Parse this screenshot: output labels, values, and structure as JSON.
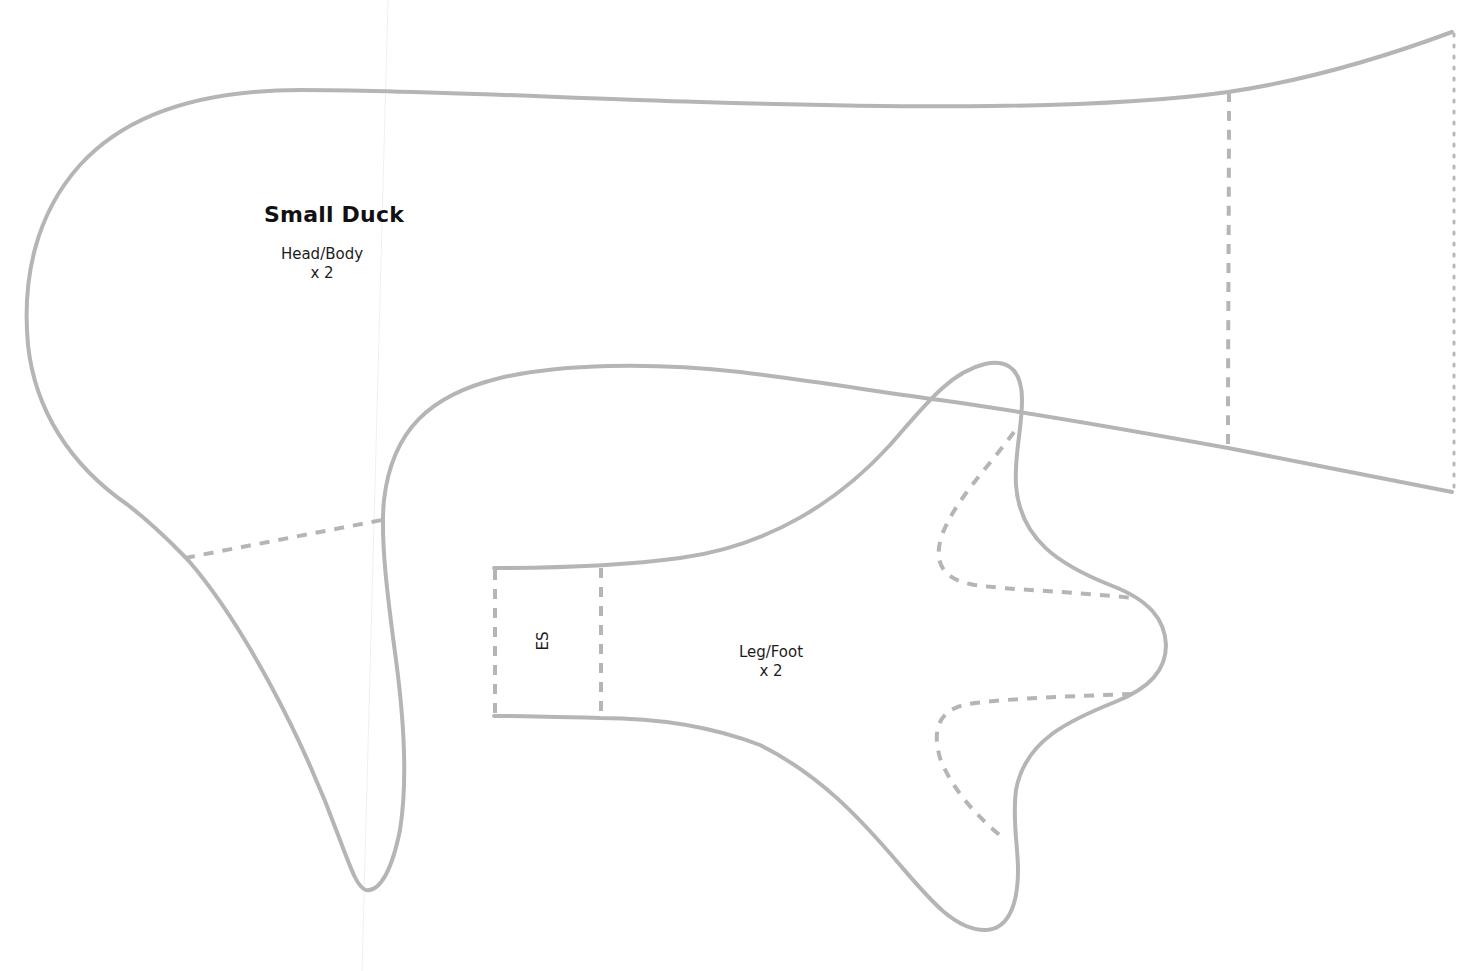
{
  "pattern": {
    "title": "Small Duck",
    "pieces": [
      {
        "id": "head-body",
        "name": "Head/Body",
        "count": "x 2"
      },
      {
        "id": "leg-foot",
        "name": "Leg/Foot",
        "count": "x 2",
        "marking": "ES"
      }
    ],
    "colors": {
      "outline": "#b5b5b5",
      "text": "#1c1c1c",
      "background": "#ffffff"
    }
  }
}
